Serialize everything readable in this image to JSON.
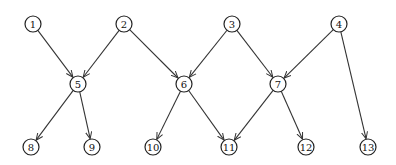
{
  "diagram": {
    "type": "directed-acyclic-graph",
    "node_radius": 8,
    "nodes": [
      {
        "id": "1",
        "label": "1",
        "x": 33,
        "y": 24
      },
      {
        "id": "2",
        "label": "2",
        "x": 124,
        "y": 24
      },
      {
        "id": "3",
        "label": "3",
        "x": 232,
        "y": 24
      },
      {
        "id": "4",
        "label": "4",
        "x": 339,
        "y": 24
      },
      {
        "id": "5",
        "label": "5",
        "x": 78,
        "y": 84
      },
      {
        "id": "6",
        "label": "6",
        "x": 184,
        "y": 84
      },
      {
        "id": "7",
        "label": "7",
        "x": 278,
        "y": 84
      },
      {
        "id": "8",
        "label": "8",
        "x": 31,
        "y": 147
      },
      {
        "id": "9",
        "label": "9",
        "x": 92,
        "y": 147
      },
      {
        "id": "10",
        "label": "10",
        "x": 153,
        "y": 147
      },
      {
        "id": "11",
        "label": "11",
        "x": 229,
        "y": 147
      },
      {
        "id": "12",
        "label": "12",
        "x": 306,
        "y": 147
      },
      {
        "id": "13",
        "label": "13",
        "x": 368,
        "y": 147
      }
    ],
    "edges": [
      {
        "from": "1",
        "to": "5"
      },
      {
        "from": "2",
        "to": "5"
      },
      {
        "from": "2",
        "to": "6"
      },
      {
        "from": "3",
        "to": "6"
      },
      {
        "from": "3",
        "to": "7"
      },
      {
        "from": "4",
        "to": "7"
      },
      {
        "from": "4",
        "to": "13"
      },
      {
        "from": "5",
        "to": "8"
      },
      {
        "from": "5",
        "to": "9"
      },
      {
        "from": "6",
        "to": "10"
      },
      {
        "from": "6",
        "to": "11"
      },
      {
        "from": "7",
        "to": "11"
      },
      {
        "from": "7",
        "to": "12"
      }
    ],
    "colors": {
      "stroke": "#222222",
      "background": "#ffffff"
    }
  }
}
